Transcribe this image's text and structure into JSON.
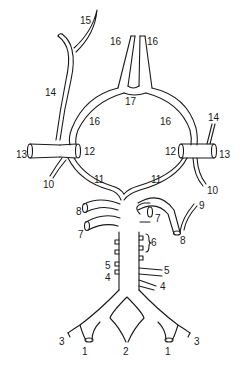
{
  "diagram": {
    "type": "anatomical-vessel-diagram",
    "labels": [
      {
        "id": "l15",
        "text": "15",
        "x": 80,
        "y": 16
      },
      {
        "id": "l14a",
        "text": "14",
        "x": 45,
        "y": 88
      },
      {
        "id": "l16a",
        "text": "16",
        "x": 110,
        "y": 37
      },
      {
        "id": "l16b",
        "text": "16",
        "x": 147,
        "y": 37
      },
      {
        "id": "l17",
        "text": "17",
        "x": 125,
        "y": 97
      },
      {
        "id": "l16c",
        "text": "16",
        "x": 89,
        "y": 117
      },
      {
        "id": "l16d",
        "text": "16",
        "x": 160,
        "y": 117
      },
      {
        "id": "l14b",
        "text": "14",
        "x": 208,
        "y": 113
      },
      {
        "id": "l13a",
        "text": "13",
        "x": 16,
        "y": 150
      },
      {
        "id": "l12a",
        "text": "12",
        "x": 84,
        "y": 147
      },
      {
        "id": "l12b",
        "text": "12",
        "x": 165,
        "y": 147
      },
      {
        "id": "l13b",
        "text": "13",
        "x": 219,
        "y": 150
      },
      {
        "id": "l10a",
        "text": "10",
        "x": 43,
        "y": 180
      },
      {
        "id": "l10b",
        "text": "10",
        "x": 207,
        "y": 186
      },
      {
        "id": "l11a",
        "text": "11",
        "x": 94,
        "y": 175
      },
      {
        "id": "l11b",
        "text": "11",
        "x": 151,
        "y": 175
      },
      {
        "id": "l8a",
        "text": "8",
        "x": 76,
        "y": 207
      },
      {
        "id": "l9",
        "text": "9",
        "x": 199,
        "y": 201
      },
      {
        "id": "l7a",
        "text": "7",
        "x": 78,
        "y": 230
      },
      {
        "id": "l7b",
        "text": "7",
        "x": 155,
        "y": 214
      },
      {
        "id": "l8b",
        "text": "8",
        "x": 180,
        "y": 236
      },
      {
        "id": "l6",
        "text": "6",
        "x": 151,
        "y": 242
      },
      {
        "id": "l5a",
        "text": "5",
        "x": 105,
        "y": 261
      },
      {
        "id": "l5b",
        "text": "5",
        "x": 164,
        "y": 266
      },
      {
        "id": "l4a",
        "text": "4",
        "x": 105,
        "y": 273
      },
      {
        "id": "l4b",
        "text": "4",
        "x": 160,
        "y": 282
      },
      {
        "id": "l3a",
        "text": "3",
        "x": 59,
        "y": 339
      },
      {
        "id": "l3b",
        "text": "3",
        "x": 194,
        "y": 339
      },
      {
        "id": "l1a",
        "text": "1",
        "x": 82,
        "y": 347
      },
      {
        "id": "l2",
        "text": "2",
        "x": 122,
        "y": 347
      },
      {
        "id": "l1b",
        "text": "1",
        "x": 165,
        "y": 347
      }
    ]
  }
}
